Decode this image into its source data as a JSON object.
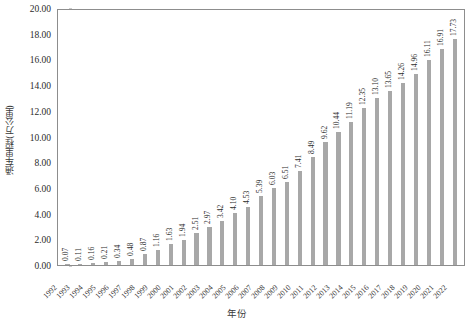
{
  "chart_data": {
    "type": "bar",
    "title": "",
    "xlabel": "年份",
    "ylabel": "通车里程(万公里)",
    "ylim": [
      0.0,
      20.0
    ],
    "yticks": [
      "0.00",
      "2.00",
      "4.00",
      "6.00",
      "8.00",
      "10.00",
      "12.00",
      "14.00",
      "16.00",
      "18.00",
      "20.00"
    ],
    "grid": false,
    "legend": false,
    "bar_color": "#a8a8a8",
    "categories": [
      "1992",
      "1993",
      "1994",
      "1995",
      "1996",
      "1997",
      "1998",
      "1999",
      "2000",
      "2001",
      "2002",
      "2003",
      "2004",
      "2005",
      "2006",
      "2007",
      "2008",
      "2009",
      "2010",
      "2011",
      "2012",
      "2013",
      "2014",
      "2015",
      "2016",
      "2017",
      "2018",
      "2019",
      "2020",
      "2021",
      "2022"
    ],
    "values": [
      0.07,
      0.11,
      0.16,
      0.21,
      0.34,
      0.48,
      0.87,
      1.16,
      1.63,
      1.94,
      2.51,
      2.97,
      3.42,
      4.1,
      4.53,
      5.39,
      6.03,
      6.51,
      7.41,
      8.49,
      9.62,
      10.44,
      11.19,
      12.35,
      13.1,
      13.65,
      14.26,
      14.96,
      16.11,
      16.91,
      17.73
    ],
    "value_labels": [
      "0.07",
      "0.11",
      "0.16",
      "0.21",
      "0.34",
      "0.48",
      "0.87",
      "1.16",
      "1.63",
      "1.94",
      "2.51",
      "2.97",
      "3.42",
      "4.10",
      "4.53",
      "5.39",
      "6.03",
      "6.51",
      "7.41",
      "8.49",
      "9.62",
      "10.44",
      "11.19",
      "12.35",
      "13.10",
      "13.65",
      "14.26",
      "14.96",
      "16.11",
      "16.91",
      "17.73"
    ]
  }
}
